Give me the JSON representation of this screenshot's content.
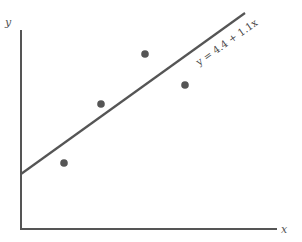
{
  "chart_data": {
    "type": "scatter",
    "title": "",
    "xlabel": "x",
    "ylabel": "y",
    "grid": false,
    "legend": null,
    "points": [
      {
        "x": 64,
        "y": 163
      },
      {
        "x": 101,
        "y": 104
      },
      {
        "x": 145,
        "y": 54
      },
      {
        "x": 185,
        "y": 85
      }
    ],
    "regression_line": {
      "label": "y = 4.4 + 1.1x",
      "intercept": 4.4,
      "slope": 1.1,
      "start": {
        "x": 21,
        "y": 174
      },
      "end": {
        "x": 245,
        "y": 13
      }
    },
    "axes": {
      "origin": {
        "x": 21,
        "y": 229
      },
      "y_top": 30,
      "x_right": 277
    },
    "colors": {
      "axis": "#555555",
      "line": "#555555",
      "points": "#555555"
    }
  },
  "labels": {
    "x_axis": "x",
    "y_axis": "y",
    "equation": "y = 4.4 + 1.1x"
  }
}
